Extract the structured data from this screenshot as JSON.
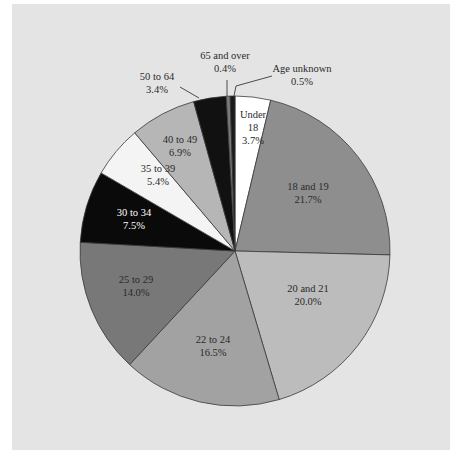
{
  "chart_data": {
    "type": "pie",
    "title": "",
    "start_angle_deg": 0,
    "direction": "clockwise",
    "center": [
      235,
      251
    ],
    "radius": 155,
    "slices": [
      {
        "label": "Under 18",
        "label_lines": [
          "Under",
          "18",
          "3.7%"
        ],
        "value": 3.7,
        "color": "#ffffff",
        "text_color": "#2a2a2a",
        "label_pos": [
          253,
          118
        ],
        "callout": false
      },
      {
        "label": "18 and 19",
        "label_lines": [
          "18 and 19",
          "21.7%"
        ],
        "value": 21.7,
        "color": "#8e8e8e",
        "text_color": "#2a2a2a",
        "label_pos": [
          308,
          190
        ],
        "callout": false
      },
      {
        "label": "20 and 21",
        "label_lines": [
          "20 and 21",
          "20.0%"
        ],
        "value": 20.0,
        "color": "#bcbcbc",
        "text_color": "#2a2a2a",
        "label_pos": [
          308,
          292
        ],
        "callout": false
      },
      {
        "label": "22 to 24",
        "label_lines": [
          "22 to 24",
          "16.5%"
        ],
        "value": 16.5,
        "color": "#a2a2a2",
        "text_color": "#2a2a2a",
        "label_pos": [
          213,
          343
        ],
        "callout": false
      },
      {
        "label": "25 to 29",
        "label_lines": [
          "25 to 29",
          "14.0%"
        ],
        "value": 14.0,
        "color": "#787878",
        "text_color": "#2a2a2a",
        "label_pos": [
          136,
          283
        ],
        "callout": false
      },
      {
        "label": "30 to 34",
        "label_lines": [
          "30 to 34",
          "7.5%"
        ],
        "value": 7.5,
        "color": "#0a0a0a",
        "text_color": "#ffffff",
        "label_pos": [
          134,
          216
        ],
        "callout": false
      },
      {
        "label": "35 to 39",
        "label_lines": [
          "35 to 39",
          "5.4%"
        ],
        "value": 5.4,
        "color": "#f4f4f4",
        "text_color": "#2a2a2a",
        "label_pos": [
          158,
          172
        ],
        "callout": false
      },
      {
        "label": "40 to 49",
        "label_lines": [
          "40 to 49",
          "6.9%"
        ],
        "value": 6.9,
        "color": "#b6b6b6",
        "text_color": "#2a2a2a",
        "label_pos": [
          180,
          143
        ],
        "callout": false
      },
      {
        "label": "50 to 64",
        "label_lines": [
          "50 to 64",
          "3.4%"
        ],
        "value": 3.4,
        "color": "#111111",
        "text_color": "#2a2a2a",
        "label_pos": [
          157,
          80
        ],
        "callout": true,
        "leader": [
          [
            180,
            87
          ],
          [
            199,
            98
          ]
        ]
      },
      {
        "label": "65 and over",
        "label_lines": [
          "65 and over",
          "0.4%"
        ],
        "value": 0.4,
        "color": "#7a7a7a",
        "text_color": "#2a2a2a",
        "label_pos": [
          225,
          59
        ],
        "callout": true,
        "leader": [
          [
            227,
            80
          ],
          [
            227,
            96
          ]
        ]
      },
      {
        "label": "Age unknown",
        "label_lines": [
          "Age unknown",
          "0.5%"
        ],
        "value": 0.5,
        "color": "#1a1a1a",
        "text_color": "#2a2a2a",
        "label_pos": [
          302,
          72
        ],
        "callout": true,
        "leader": [
          [
            272,
            76
          ],
          [
            236,
            86
          ],
          [
            234,
            96
          ]
        ]
      }
    ],
    "legend": "none",
    "units": "percent"
  }
}
